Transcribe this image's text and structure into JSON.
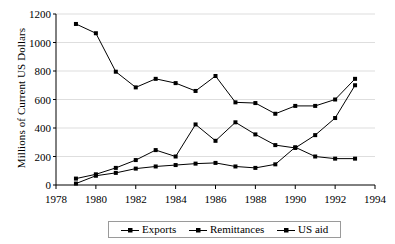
{
  "chart_data": {
    "type": "line",
    "title": "",
    "xlabel": "",
    "ylabel": "Millions of Current US Dollars",
    "xlim": [
      1978,
      1994
    ],
    "ylim": [
      0,
      1200
    ],
    "xticks": [
      1978,
      1980,
      1982,
      1984,
      1986,
      1988,
      1990,
      1992,
      1994
    ],
    "yticks": [
      0,
      200,
      400,
      600,
      800,
      1000,
      1200
    ],
    "grid": true,
    "legend_position": "bottom-center",
    "x": [
      1979,
      1980,
      1981,
      1982,
      1983,
      1984,
      1985,
      1986,
      1987,
      1988,
      1989,
      1990,
      1991,
      1992,
      1993
    ],
    "series": [
      {
        "name": "Exports",
        "marker": "square",
        "values": [
          1130,
          1065,
          795,
          685,
          745,
          715,
          660,
          765,
          580,
          575,
          500,
          555,
          555,
          600,
          745
        ]
      },
      {
        "name": "Remittances",
        "marker": "square",
        "values": [
          45,
          75,
          120,
          175,
          245,
          200,
          425,
          310,
          440,
          355,
          280,
          260,
          350,
          470,
          700
        ]
      },
      {
        "name": "US aid",
        "marker": "square",
        "values": [
          10,
          65,
          85,
          115,
          130,
          140,
          150,
          155,
          130,
          120,
          145,
          265,
          200,
          185,
          185
        ]
      }
    ]
  },
  "legend": {
    "items": [
      {
        "label": "Exports"
      },
      {
        "label": "Remittances"
      },
      {
        "label": "US aid"
      }
    ]
  },
  "axes": {
    "y_title": "Millions of Current US Dollars",
    "y_tick_labels": [
      "1200",
      "1000",
      "800",
      "600",
      "400",
      "200",
      "0"
    ],
    "x_tick_labels": [
      "1978",
      "1980",
      "1982",
      "1984",
      "1986",
      "1988",
      "1990",
      "1992",
      "1994"
    ]
  }
}
